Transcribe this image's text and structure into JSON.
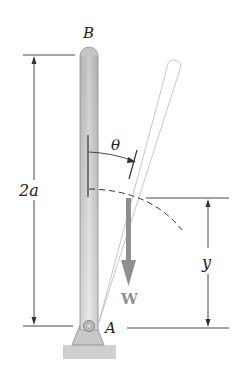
{
  "labels": {
    "top_point": "B",
    "pivot_point": "A",
    "length_dimension": "2a",
    "angle": "θ",
    "height_dimension": "y",
    "weight": "W"
  },
  "colors": {
    "rod_fill_top": "#c9c9c9",
    "rod_fill_bottom": "#e6e6e6",
    "rod_outline": "#9a9a9a",
    "ghost_rod_outline": "#bdbdbd",
    "weight_arrow": "#8f8f8f",
    "ground": "#cfcfcf",
    "line": "#333333"
  }
}
